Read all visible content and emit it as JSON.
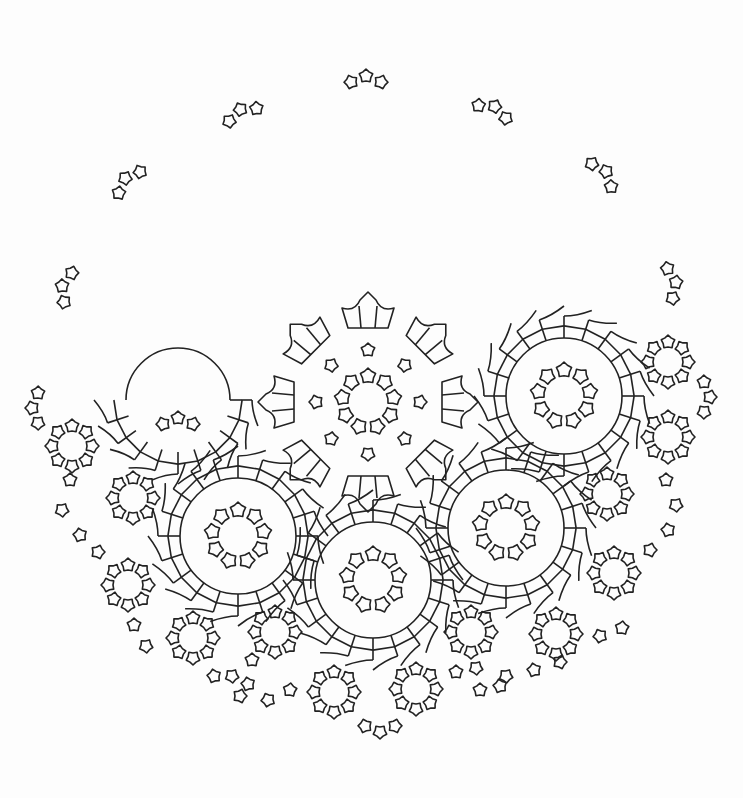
{
  "canvas": {
    "width": 743,
    "height": 798,
    "background": "#fdfdfd",
    "stroke": "#222222"
  },
  "trefoils": [
    {
      "x": 366,
      "y": 80,
      "rot": 0
    },
    {
      "x": 242,
      "y": 113,
      "rot": -25
    },
    {
      "x": 493,
      "y": 110,
      "rot": 25
    },
    {
      "x": 128,
      "y": 181,
      "rot": -45
    },
    {
      "x": 603,
      "y": 174,
      "rot": 50
    },
    {
      "x": 66,
      "y": 287,
      "rot": -75
    },
    {
      "x": 672,
      "y": 283,
      "rot": 80
    },
    {
      "x": 36,
      "y": 408,
      "rot": -90
    },
    {
      "x": 706,
      "y": 397,
      "rot": 90
    },
    {
      "x": 178,
      "y": 422,
      "rot": 0
    },
    {
      "x": 380,
      "y": 728,
      "rot": 180
    }
  ],
  "wheels": [
    {
      "x": 368,
      "y": 402,
      "r_inner": 0,
      "r_outer": 0,
      "big": true
    },
    {
      "x": 564,
      "y": 396,
      "r_inner": 58,
      "r_outer": 80
    },
    {
      "x": 238,
      "y": 536,
      "r_inner": 58,
      "r_outer": 80
    },
    {
      "x": 506,
      "y": 528,
      "r_inner": 58,
      "r_outer": 80
    },
    {
      "x": 373,
      "y": 580,
      "r_inner": 58,
      "r_outer": 80
    }
  ],
  "arc_left": {
    "x": 178,
    "y": 400,
    "r_inner": 52,
    "r_outer": 74
  },
  "rosettes": [
    {
      "x": 368,
      "y": 402,
      "r": 26,
      "n": 9
    },
    {
      "x": 564,
      "y": 396,
      "r": 26,
      "n": 9
    },
    {
      "x": 238,
      "y": 536,
      "r": 26,
      "n": 9
    },
    {
      "x": 506,
      "y": 528,
      "r": 26,
      "n": 9
    },
    {
      "x": 373,
      "y": 580,
      "r": 26,
      "n": 9
    },
    {
      "x": 668,
      "y": 362,
      "r": 20,
      "n": 8
    },
    {
      "x": 668,
      "y": 437,
      "r": 20,
      "n": 8
    },
    {
      "x": 72,
      "y": 446,
      "r": 20,
      "n": 8
    },
    {
      "x": 133,
      "y": 498,
      "r": 20,
      "n": 8
    },
    {
      "x": 607,
      "y": 494,
      "r": 20,
      "n": 8
    },
    {
      "x": 128,
      "y": 585,
      "r": 20,
      "n": 8
    },
    {
      "x": 614,
      "y": 573,
      "r": 20,
      "n": 8
    },
    {
      "x": 193,
      "y": 638,
      "r": 20,
      "n": 8
    },
    {
      "x": 275,
      "y": 632,
      "r": 20,
      "n": 8
    },
    {
      "x": 471,
      "y": 632,
      "r": 20,
      "n": 8
    },
    {
      "x": 556,
      "y": 634,
      "r": 20,
      "n": 8
    },
    {
      "x": 334,
      "y": 692,
      "r": 20,
      "n": 8
    },
    {
      "x": 416,
      "y": 689,
      "r": 20,
      "n": 8
    }
  ],
  "chains": [
    {
      "points": [
        [
          70,
          480
        ],
        [
          62,
          510
        ],
        [
          80,
          535
        ],
        [
          98,
          552
        ]
      ]
    },
    {
      "points": [
        [
          666,
          480
        ],
        [
          676,
          505
        ],
        [
          668,
          530
        ],
        [
          650,
          550
        ]
      ]
    },
    {
      "points": [
        [
          134,
          625
        ],
        [
          146,
          646
        ],
        [
          214,
          676
        ],
        [
          240,
          696
        ],
        [
          268,
          700
        ],
        [
          290,
          690
        ]
      ]
    },
    {
      "points": [
        [
          480,
          690
        ],
        [
          506,
          676
        ],
        [
          534,
          670
        ],
        [
          560,
          662
        ],
        [
          600,
          636
        ],
        [
          622,
          628
        ]
      ]
    },
    {
      "points": [
        [
          252,
          660
        ],
        [
          232,
          676
        ],
        [
          248,
          684
        ]
      ]
    },
    {
      "points": [
        [
          456,
          672
        ],
        [
          476,
          668
        ],
        [
          500,
          686
        ]
      ]
    }
  ],
  "center_motif": {
    "x": 368,
    "y": 402,
    "stars_ring": {
      "r": 52,
      "n": 8
    },
    "cups_ring": {
      "r": 88,
      "n": 8
    }
  }
}
